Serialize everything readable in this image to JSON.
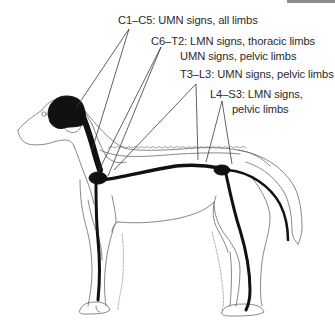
{
  "figure": {
    "colors": {
      "outline": "#6a6a6a",
      "nervous_system": "#111111",
      "leader_line": "#3a3a3a",
      "text": "#2b2b2b",
      "top_bar": "#8c8c8c"
    }
  },
  "labels": [
    {
      "id": "c1-c5",
      "lines": [
        "C1–C5: UMN signs, all limbs"
      ]
    },
    {
      "id": "c6-t2",
      "lines": [
        "C6–T2: LMN signs, thoracic limbs",
        "UMN signs, pelvic limbs"
      ]
    },
    {
      "id": "t3-l3",
      "lines": [
        "T3–L3: UMN signs, pelvic limbs"
      ]
    },
    {
      "id": "l4-s3",
      "lines": [
        "L4–S3: LMN signs,",
        "pelvic limbs"
      ]
    }
  ]
}
